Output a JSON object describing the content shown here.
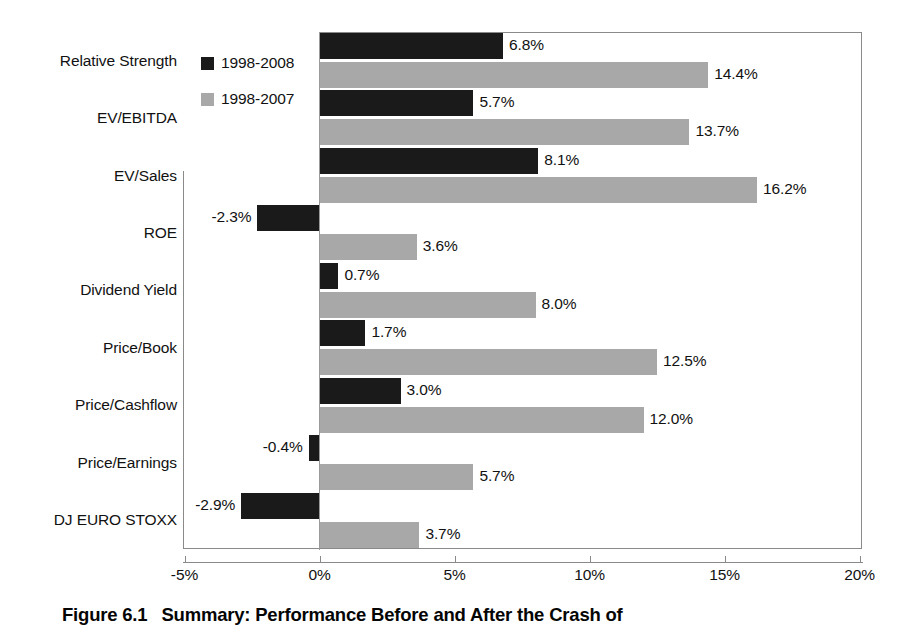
{
  "caption": {
    "figure_number": "Figure 6.1",
    "text": "Summary: Performance Before and After the Crash of"
  },
  "legend": {
    "position": "top-left-inside-plot",
    "items": [
      {
        "label": "1998-2008",
        "color": "#1a1a1a",
        "swatch": "dark-square-swatch"
      },
      {
        "label": "1998-2007",
        "color": "#a8a8a8",
        "swatch": "light-square-swatch"
      }
    ]
  },
  "axis": {
    "x_ticks": [
      "-5%",
      "0%",
      "5%",
      "10%",
      "15%",
      "20%"
    ],
    "x_tick_values": [
      -5,
      0,
      5,
      10,
      15,
      20
    ],
    "x_min": -5,
    "x_max": 20
  },
  "chart_data": {
    "type": "bar",
    "orientation": "horizontal",
    "xlabel": "",
    "ylabel": "",
    "xlim": [
      -5,
      20
    ],
    "grid": false,
    "legend_position": "top-left",
    "categories": [
      "Relative Strength",
      "EV/EBITDA",
      "EV/Sales",
      "ROE",
      "Dividend Yield",
      "Price/Book",
      "Price/Cashflow",
      "Price/Earnings",
      "DJ EURO STOXX"
    ],
    "series": [
      {
        "name": "1998-2008",
        "color": "#1a1a1a",
        "values": [
          6.8,
          5.7,
          8.1,
          -2.3,
          0.7,
          1.7,
          3.0,
          -0.4,
          -2.9
        ],
        "labels": [
          "6.8%",
          "5.7%",
          "8.1%",
          "-2.3%",
          "0.7%",
          "1.7%",
          "3.0%",
          "-0.4%",
          "-2.9%"
        ]
      },
      {
        "name": "1998-2007",
        "color": "#a8a8a8",
        "values": [
          14.4,
          13.7,
          16.2,
          3.6,
          8.0,
          12.5,
          12.0,
          5.7,
          3.7
        ],
        "labels": [
          "14.4%",
          "13.7%",
          "16.2%",
          "3.6%",
          "8.0%",
          "12.5%",
          "12.0%",
          "5.7%",
          "3.7%"
        ]
      }
    ]
  }
}
